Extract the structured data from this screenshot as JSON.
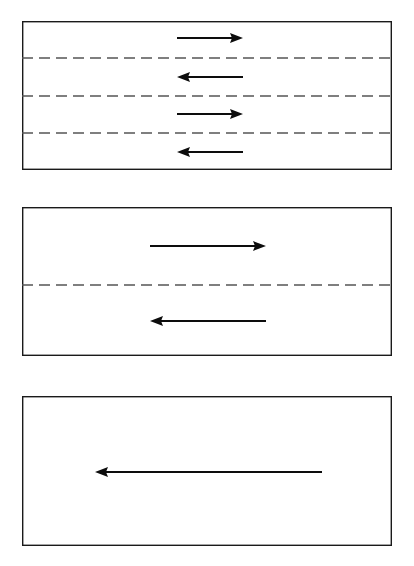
{
  "figure": {
    "background_color": "#ffffff",
    "line_color": "#0d0d0d",
    "dashed_line_color": "#555555",
    "frame_color": "#1a1a1a",
    "width": 414,
    "height": 566,
    "panel_count": 3
  },
  "chart_data": {
    "type": "diagram",
    "xlabel": "",
    "ylabel": "",
    "xlim": [
      0,
      414
    ],
    "ylim": [
      0,
      566
    ],
    "grid": false,
    "legend": "none",
    "panels": [
      {
        "id": "panel-1",
        "label": "a",
        "frame": {
          "x": 22,
          "y": 21,
          "width": 370,
          "height": 149
        },
        "dashed_lines": [
          {
            "id": "interface-1-1",
            "y": 58,
            "x_start": 22,
            "x_end": 392
          },
          {
            "id": "interface-1-2",
            "y": 96,
            "x_start": 22,
            "x_end": 392
          },
          {
            "id": "interface-1-3",
            "y": 133,
            "x_start": 22,
            "x_end": 392
          }
        ],
        "arrows": [
          {
            "id": "arrow-1-1",
            "direction": "right",
            "y": 38,
            "x_start": 177,
            "x_end": 243,
            "length": 66
          },
          {
            "id": "arrow-1-2",
            "direction": "left",
            "y": 77,
            "x_start": 243,
            "x_end": 177,
            "length": 66
          },
          {
            "id": "arrow-1-3",
            "direction": "right",
            "y": 114,
            "x_start": 177,
            "x_end": 243,
            "length": 66
          },
          {
            "id": "arrow-1-4",
            "direction": "left",
            "y": 152,
            "x_start": 243,
            "x_end": 177,
            "length": 66
          }
        ]
      },
      {
        "id": "panel-2",
        "label": "b",
        "frame": {
          "x": 22,
          "y": 207,
          "width": 370,
          "height": 149
        },
        "dashed_lines": [
          {
            "id": "interface-2-1",
            "y": 285,
            "x_start": 22,
            "x_end": 392
          }
        ],
        "arrows": [
          {
            "id": "arrow-2-1",
            "direction": "right",
            "y": 246,
            "x_start": 150,
            "x_end": 266,
            "length": 116
          },
          {
            "id": "arrow-2-2",
            "direction": "left",
            "y": 321,
            "x_start": 266,
            "x_end": 150,
            "length": 116
          }
        ]
      },
      {
        "id": "panel-3",
        "label": "c",
        "frame": {
          "x": 22,
          "y": 396,
          "width": 370,
          "height": 150
        },
        "dashed_lines": [],
        "arrows": [
          {
            "id": "arrow-3-1",
            "direction": "left",
            "y": 472,
            "x_start": 322,
            "x_end": 95,
            "length": 227
          }
        ]
      }
    ]
  }
}
